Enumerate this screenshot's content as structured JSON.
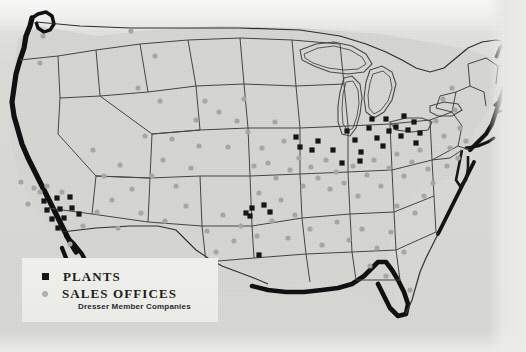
{
  "map": {
    "title": "United States plant and sales office locations map",
    "region": "Continental United States",
    "style": "printed halftone black and white map",
    "background_color": "#dcdcd8",
    "outline_color": "#3a3a3d",
    "coastline_color": "#111113"
  },
  "legend": {
    "background_color": "#ededea",
    "entries": [
      {
        "marker": "plant-square-marker",
        "symbol": "filled-square",
        "color": "#17171a",
        "label": "PLANTS"
      },
      {
        "marker": "sales-office-dot-marker",
        "symbol": "filled-circle",
        "color": "#b0b0ad",
        "label": "SALES OFFICES"
      }
    ],
    "subtitle": "Dresser Member Companies"
  },
  "markers": {
    "plant_color": "#17171a",
    "office_color": "#a9a9a6",
    "plants": [
      {
        "x": 44,
        "y": 201
      },
      {
        "x": 57,
        "y": 198
      },
      {
        "x": 70,
        "y": 197
      },
      {
        "x": 47,
        "y": 210
      },
      {
        "x": 60,
        "y": 209
      },
      {
        "x": 72,
        "y": 208
      },
      {
        "x": 52,
        "y": 219
      },
      {
        "x": 64,
        "y": 218
      },
      {
        "x": 58,
        "y": 228
      },
      {
        "x": 79,
        "y": 214
      },
      {
        "x": 246,
        "y": 213
      },
      {
        "x": 252,
        "y": 208
      },
      {
        "x": 259,
        "y": 255
      },
      {
        "x": 250,
        "y": 216
      },
      {
        "x": 264,
        "y": 205
      },
      {
        "x": 270,
        "y": 212
      },
      {
        "x": 296,
        "y": 137
      },
      {
        "x": 300,
        "y": 147
      },
      {
        "x": 312,
        "y": 150
      },
      {
        "x": 318,
        "y": 141
      },
      {
        "x": 333,
        "y": 150
      },
      {
        "x": 347,
        "y": 131
      },
      {
        "x": 355,
        "y": 140
      },
      {
        "x": 361,
        "y": 152
      },
      {
        "x": 369,
        "y": 128
      },
      {
        "x": 377,
        "y": 138
      },
      {
        "x": 383,
        "y": 146
      },
      {
        "x": 389,
        "y": 131
      },
      {
        "x": 396,
        "y": 127
      },
      {
        "x": 401,
        "y": 136
      },
      {
        "x": 408,
        "y": 130
      },
      {
        "x": 414,
        "y": 122
      },
      {
        "x": 420,
        "y": 133
      },
      {
        "x": 372,
        "y": 119
      },
      {
        "x": 386,
        "y": 119
      },
      {
        "x": 404,
        "y": 116
      },
      {
        "x": 416,
        "y": 143
      },
      {
        "x": 360,
        "y": 161
      },
      {
        "x": 342,
        "y": 163
      }
    ],
    "offices": [
      {
        "x": 43,
        "y": 36
      },
      {
        "x": 40,
        "y": 63
      },
      {
        "x": 131,
        "y": 31
      },
      {
        "x": 138,
        "y": 88
      },
      {
        "x": 155,
        "y": 56
      },
      {
        "x": 160,
        "y": 101
      },
      {
        "x": 145,
        "y": 136
      },
      {
        "x": 172,
        "y": 139
      },
      {
        "x": 196,
        "y": 120
      },
      {
        "x": 199,
        "y": 146
      },
      {
        "x": 205,
        "y": 101
      },
      {
        "x": 219,
        "y": 112
      },
      {
        "x": 228,
        "y": 147
      },
      {
        "x": 237,
        "y": 121
      },
      {
        "x": 244,
        "y": 99
      },
      {
        "x": 248,
        "y": 132
      },
      {
        "x": 254,
        "y": 166
      },
      {
        "x": 262,
        "y": 148
      },
      {
        "x": 268,
        "y": 163
      },
      {
        "x": 275,
        "y": 122
      },
      {
        "x": 284,
        "y": 141
      },
      {
        "x": 276,
        "y": 178
      },
      {
        "x": 290,
        "y": 170
      },
      {
        "x": 299,
        "y": 158
      },
      {
        "x": 303,
        "y": 186
      },
      {
        "x": 311,
        "y": 167
      },
      {
        "x": 318,
        "y": 178
      },
      {
        "x": 326,
        "y": 160
      },
      {
        "x": 330,
        "y": 189
      },
      {
        "x": 336,
        "y": 172
      },
      {
        "x": 344,
        "y": 183
      },
      {
        "x": 353,
        "y": 166
      },
      {
        "x": 358,
        "y": 196
      },
      {
        "x": 367,
        "y": 175
      },
      {
        "x": 374,
        "y": 160
      },
      {
        "x": 381,
        "y": 186
      },
      {
        "x": 389,
        "y": 168
      },
      {
        "x": 397,
        "y": 154
      },
      {
        "x": 404,
        "y": 176
      },
      {
        "x": 412,
        "y": 162
      },
      {
        "x": 420,
        "y": 150
      },
      {
        "x": 428,
        "y": 169
      },
      {
        "x": 436,
        "y": 121
      },
      {
        "x": 444,
        "y": 136
      },
      {
        "x": 450,
        "y": 148
      },
      {
        "x": 455,
        "y": 110
      },
      {
        "x": 460,
        "y": 128
      },
      {
        "x": 466,
        "y": 141
      },
      {
        "x": 443,
        "y": 99
      },
      {
        "x": 452,
        "y": 88
      },
      {
        "x": 458,
        "y": 158
      },
      {
        "x": 447,
        "y": 166
      },
      {
        "x": 21,
        "y": 182
      },
      {
        "x": 34,
        "y": 188
      },
      {
        "x": 47,
        "y": 186
      },
      {
        "x": 62,
        "y": 192
      },
      {
        "x": 28,
        "y": 204
      },
      {
        "x": 40,
        "y": 192
      },
      {
        "x": 93,
        "y": 150
      },
      {
        "x": 104,
        "y": 176
      },
      {
        "x": 112,
        "y": 200
      },
      {
        "x": 120,
        "y": 165
      },
      {
        "x": 132,
        "y": 189
      },
      {
        "x": 118,
        "y": 228
      },
      {
        "x": 141,
        "y": 213
      },
      {
        "x": 165,
        "y": 221
      },
      {
        "x": 186,
        "y": 206
      },
      {
        "x": 207,
        "y": 231
      },
      {
        "x": 223,
        "y": 215
      },
      {
        "x": 234,
        "y": 241
      },
      {
        "x": 216,
        "y": 252
      },
      {
        "x": 241,
        "y": 226
      },
      {
        "x": 257,
        "y": 236
      },
      {
        "x": 272,
        "y": 221
      },
      {
        "x": 288,
        "y": 238
      },
      {
        "x": 295,
        "y": 215
      },
      {
        "x": 310,
        "y": 229
      },
      {
        "x": 322,
        "y": 245
      },
      {
        "x": 337,
        "y": 222
      },
      {
        "x": 349,
        "y": 240
      },
      {
        "x": 362,
        "y": 229
      },
      {
        "x": 377,
        "y": 248
      },
      {
        "x": 391,
        "y": 232
      },
      {
        "x": 404,
        "y": 252
      },
      {
        "x": 370,
        "y": 266
      },
      {
        "x": 386,
        "y": 276
      },
      {
        "x": 410,
        "y": 290
      },
      {
        "x": 397,
        "y": 206
      },
      {
        "x": 424,
        "y": 196
      },
      {
        "x": 433,
        "y": 183
      },
      {
        "x": 415,
        "y": 213
      },
      {
        "x": 191,
        "y": 168
      },
      {
        "x": 176,
        "y": 186
      },
      {
        "x": 163,
        "y": 160
      },
      {
        "x": 152,
        "y": 176
      },
      {
        "x": 83,
        "y": 226
      },
      {
        "x": 97,
        "y": 212
      },
      {
        "x": 70,
        "y": 244
      },
      {
        "x": 259,
        "y": 193
      },
      {
        "x": 281,
        "y": 200
      }
    ]
  }
}
